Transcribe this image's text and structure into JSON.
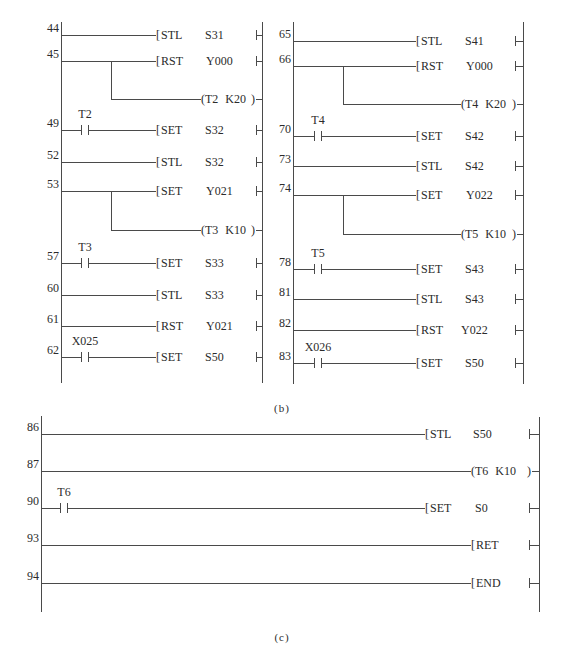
{
  "captions": {
    "b": "(b)",
    "c": "(c)"
  },
  "panel_b_left": {
    "rungs": [
      {
        "step": "44",
        "instruction": "STL",
        "operand": "S31"
      },
      {
        "step": "45",
        "instruction": "RST",
        "operand": "Y000",
        "coil_device": "T2",
        "coil_value": "K20"
      },
      {
        "step": "49",
        "contact": "T2",
        "instruction": "SET",
        "operand": "S32"
      },
      {
        "step": "52",
        "instruction": "STL",
        "operand": "S32"
      },
      {
        "step": "53",
        "instruction": "SET",
        "operand": "Y021",
        "coil_device": "T3",
        "coil_value": "K10"
      },
      {
        "step": "57",
        "contact": "T3",
        "instruction": "SET",
        "operand": "S33"
      },
      {
        "step": "60",
        "instruction": "STL",
        "operand": "S33"
      },
      {
        "step": "61",
        "instruction": "RST",
        "operand": "Y021"
      },
      {
        "step": "62",
        "contact": "X025",
        "instruction": "SET",
        "operand": "S50"
      }
    ]
  },
  "panel_b_right": {
    "rungs": [
      {
        "step": "65",
        "instruction": "STL",
        "operand": "S41"
      },
      {
        "step": "66",
        "instruction": "RST",
        "operand": "Y000",
        "coil_device": "T4",
        "coil_value": "K20"
      },
      {
        "step": "70",
        "contact": "T4",
        "instruction": "SET",
        "operand": "S42"
      },
      {
        "step": "73",
        "instruction": "STL",
        "operand": "S42"
      },
      {
        "step": "74",
        "instruction": "SET",
        "operand": "Y022",
        "coil_device": "T5",
        "coil_value": "K10"
      },
      {
        "step": "78",
        "contact": "T5",
        "instruction": "SET",
        "operand": "S43"
      },
      {
        "step": "81",
        "instruction": "STL",
        "operand": "S43"
      },
      {
        "step": "82",
        "instruction": "RST",
        "operand": "Y022"
      },
      {
        "step": "83",
        "contact": "X026",
        "instruction": "SET",
        "operand": "S50"
      }
    ]
  },
  "panel_c": {
    "rungs": [
      {
        "step": "86",
        "instruction": "STL",
        "operand": "S50"
      },
      {
        "step": "87",
        "coil_device": "T6",
        "coil_value": "K10"
      },
      {
        "step": "90",
        "contact": "T6",
        "instruction": "SET",
        "operand": "S0"
      },
      {
        "step": "93",
        "instruction": "RET"
      },
      {
        "step": "94",
        "instruction": "END"
      }
    ]
  }
}
